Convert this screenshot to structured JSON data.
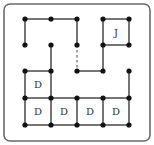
{
  "puzzle": {
    "grid": {
      "cols": 5,
      "rows": 5,
      "x": [
        25,
        51,
        77,
        103,
        129
      ],
      "y": [
        19,
        45,
        71,
        98,
        125
      ]
    },
    "frame": {
      "x": 4,
      "y": 4,
      "w": 146,
      "h": 137,
      "radius": 6,
      "stroke": "#6b6b6b"
    },
    "colors": {
      "line": "#2a2a2a",
      "dot": "#111111",
      "label": "#333333",
      "dashed": "#444444"
    },
    "dots": [
      [
        0,
        0
      ],
      [
        1,
        0
      ],
      [
        2,
        0
      ],
      [
        3,
        0
      ],
      [
        4,
        0
      ],
      [
        0,
        1
      ],
      [
        1,
        1
      ],
      [
        2,
        1
      ],
      [
        3,
        1
      ],
      [
        4,
        1
      ],
      [
        0,
        2
      ],
      [
        1,
        2
      ],
      [
        2,
        2
      ],
      [
        3,
        2
      ],
      [
        4,
        2
      ],
      [
        0,
        3
      ],
      [
        1,
        3
      ],
      [
        2,
        3
      ],
      [
        3,
        3
      ],
      [
        4,
        3
      ],
      [
        0,
        4
      ],
      [
        1,
        4
      ],
      [
        2,
        4
      ],
      [
        3,
        4
      ],
      [
        4,
        4
      ]
    ],
    "edges": [
      {
        "from": [
          0,
          0
        ],
        "to": [
          1,
          0
        ]
      },
      {
        "from": [
          1,
          0
        ],
        "to": [
          2,
          0
        ]
      },
      {
        "from": [
          3,
          0
        ],
        "to": [
          4,
          0
        ]
      },
      {
        "from": [
          0,
          0
        ],
        "to": [
          0,
          1
        ]
      },
      {
        "from": [
          2,
          0
        ],
        "to": [
          2,
          1
        ]
      },
      {
        "from": [
          3,
          0
        ],
        "to": [
          3,
          1
        ]
      },
      {
        "from": [
          4,
          0
        ],
        "to": [
          4,
          1
        ]
      },
      {
        "from": [
          3,
          1
        ],
        "to": [
          4,
          1
        ]
      },
      {
        "from": [
          2,
          1
        ],
        "to": [
          2,
          2
        ],
        "style": "dashed"
      },
      {
        "from": [
          3,
          1
        ],
        "to": [
          3,
          2
        ]
      },
      {
        "from": [
          2,
          2
        ],
        "to": [
          3,
          2
        ]
      },
      {
        "from": [
          1,
          1
        ],
        "to": [
          1,
          2
        ]
      },
      {
        "from": [
          0,
          2
        ],
        "to": [
          1,
          2
        ]
      },
      {
        "from": [
          0,
          2
        ],
        "to": [
          0,
          3
        ]
      },
      {
        "from": [
          1,
          2
        ],
        "to": [
          1,
          3
        ]
      },
      {
        "from": [
          4,
          2
        ],
        "to": [
          4,
          3
        ]
      },
      {
        "from": [
          0,
          3
        ],
        "to": [
          1,
          3
        ]
      },
      {
        "from": [
          1,
          3
        ],
        "to": [
          2,
          3
        ]
      },
      {
        "from": [
          2,
          3
        ],
        "to": [
          3,
          3
        ]
      },
      {
        "from": [
          3,
          3
        ],
        "to": [
          4,
          3
        ]
      },
      {
        "from": [
          0,
          3
        ],
        "to": [
          0,
          4
        ]
      },
      {
        "from": [
          1,
          3
        ],
        "to": [
          1,
          4
        ]
      },
      {
        "from": [
          2,
          3
        ],
        "to": [
          2,
          4
        ]
      },
      {
        "from": [
          3,
          3
        ],
        "to": [
          3,
          4
        ]
      },
      {
        "from": [
          4,
          3
        ],
        "to": [
          4,
          4
        ]
      },
      {
        "from": [
          0,
          4
        ],
        "to": [
          1,
          4
        ]
      },
      {
        "from": [
          1,
          4
        ],
        "to": [
          2,
          4
        ]
      },
      {
        "from": [
          2,
          4
        ],
        "to": [
          3,
          4
        ]
      },
      {
        "from": [
          3,
          4
        ],
        "to": [
          4,
          4
        ]
      }
    ],
    "labels": [
      {
        "text": "J",
        "cell": [
          3,
          0
        ]
      },
      {
        "text": "D",
        "cell": [
          0,
          2
        ]
      },
      {
        "text": "D",
        "cell": [
          0,
          3
        ]
      },
      {
        "text": "D",
        "cell": [
          1,
          3
        ]
      },
      {
        "text": "D",
        "cell": [
          2,
          3
        ]
      },
      {
        "text": "D",
        "cell": [
          3,
          3
        ]
      }
    ]
  }
}
